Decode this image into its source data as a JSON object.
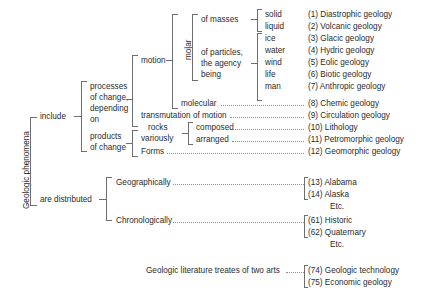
{
  "diagram": {
    "root_label": "Geologic phenomena",
    "colors": {
      "text": "#2b2b2b",
      "rule": "#6e6e6e",
      "leader": "#8d8d8d",
      "background": "#ffffff"
    },
    "branches": {
      "include": "include",
      "are_distributed": "are distributed"
    },
    "processes": {
      "label_line1": "processes",
      "label_line2": "of change,",
      "label_line3": "depending",
      "label_line4": "on"
    },
    "products": {
      "label_line1": "products",
      "label_line2": "of change"
    },
    "motion": "motion",
    "molar": "molar",
    "molecular": "molecular",
    "transmutation": "transmutation of motion",
    "of_masses": "of masses",
    "of_particles": {
      "line1": "of particles,",
      "line2": "the agency",
      "line3": "being"
    },
    "rocks": {
      "line1": "rocks",
      "line2": "variously"
    },
    "composed": "composed",
    "arranged": "arranged",
    "forms": "Forms",
    "geographically": "Geographically",
    "chronologically": "Chronologically",
    "literature": "Geologic literature treates of two arts",
    "etc": "Etc.",
    "agents": {
      "solid": "solid",
      "liquid": "liquid",
      "ice": "ice",
      "water": "water",
      "wind": "wind",
      "life": "life",
      "man": "man"
    },
    "entries": [
      {
        "num": "(1)",
        "text": "Diastrophic geology"
      },
      {
        "num": "(2)",
        "text": "Volcanic geology"
      },
      {
        "num": "(3)",
        "text": "Glacic geology"
      },
      {
        "num": "(4)",
        "text": "Hydric geology"
      },
      {
        "num": "(5)",
        "text": "Eolic geology"
      },
      {
        "num": "(6)",
        "text": "Biotic geology"
      },
      {
        "num": "(7)",
        "text": "Anthropic geology"
      },
      {
        "num": "(8)",
        "text": "Chemic geology"
      },
      {
        "num": "(9)",
        "text": "Circulation geology"
      },
      {
        "num": "(10)",
        "text": "Lithology"
      },
      {
        "num": "(11)",
        "text": "Petromorphic geology"
      },
      {
        "num": "(12)",
        "text": "Geomorphic geology"
      },
      {
        "num": "(13)",
        "text": "Alabama"
      },
      {
        "num": "(14)",
        "text": "Alaska"
      },
      {
        "num": "(61)",
        "text": "Historic"
      },
      {
        "num": "(62)",
        "text": "Quaternary"
      },
      {
        "num": "(74)",
        "text": "Geologic technology"
      },
      {
        "num": "(75)",
        "text": "Economic geology"
      }
    ]
  }
}
